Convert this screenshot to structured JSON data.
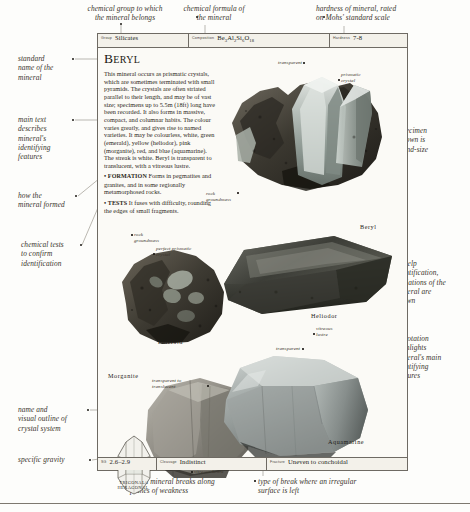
{
  "page": {
    "title": "Beryl",
    "specbar": [
      {
        "label": "Group",
        "value": "Silicates",
        "name": "field-group"
      },
      {
        "label": "Composition",
        "value": "Be3Al2Si6O18",
        "name": "field-composition"
      },
      {
        "label": "Hardness",
        "value": "7-8",
        "name": "field-hardness"
      }
    ],
    "bottombar": [
      {
        "label": "SG",
        "value": "2.6–2.9",
        "name": "field-sg"
      },
      {
        "label": "Cleavage",
        "value": "Indistinct",
        "name": "field-cleavage"
      },
      {
        "label": "Fracture",
        "value": "Uneven to conchoidal",
        "name": "field-fracture"
      }
    ],
    "body": {
      "main": "This mineral occurs as prismatic crystals, which are sometimes terminated with small pyramids. The crystals are often striated parallel to their length, and may be of vast size; specimens up to 5.5m (18ft) long have been recorded. It also forms in massive, compact, and columnar habits. The colour varies greatly, and gives rise to named varieties. It may be colourless, white, green (emerald), yellow (heliodor), pink (morganite), red, and blue (aquamarine). The streak is white. Beryl is transparent to translucent, with a vitreous lustre.",
      "formation_kw": "• FORMATION",
      "formation": "Forms in pegmatites and granites, and in some regionally metamorphosed rocks.",
      "tests_kw": "• TESTS",
      "tests": "It fuses with difficulty, rounding the edges of small fragments."
    },
    "specimen_captions": [
      {
        "text": "Beryl",
        "name": "caption-beryl"
      },
      {
        "text": "Emerald",
        "name": "caption-emerald"
      },
      {
        "text": "Heliodor",
        "name": "caption-heliodor"
      },
      {
        "text": "Morganite",
        "name": "caption-morganite"
      },
      {
        "text": "Aquamarine",
        "name": "caption-aquamarine"
      }
    ],
    "crystal_system": "TRIGONAL/\nHEXAGONAL",
    "inner_annotations": [
      {
        "text": "transparent",
        "name": "anno-transparent-top"
      },
      {
        "text": "prismatic\ncrystal",
        "name": "anno-prismatic-crystal-top"
      },
      {
        "text": "rock\ngroundmass",
        "name": "anno-rock-groundmass-top"
      },
      {
        "text": "rock\ngroundmass",
        "name": "anno-rock-groundmass-emerald"
      },
      {
        "text": "perfect prismatic\ncrystal",
        "name": "anno-perfect-prismatic-crystal"
      },
      {
        "text": "vitreous\nlustre",
        "name": "anno-vitreous-lustre-heliodor"
      },
      {
        "text": "transparent",
        "name": "anno-transparent-heliodor"
      },
      {
        "text": "transparent to\ntranslucent",
        "name": "anno-transparent-translucent"
      },
      {
        "text": "vitreous lustre",
        "name": "anno-vitreous-lustre-aquamarine"
      }
    ],
    "callouts": [
      {
        "text": "chemical group to which\nthe mineral belongs",
        "name": "callout-chemical-group"
      },
      {
        "text": "chemical formula of\nthe mineral",
        "name": "callout-chemical-formula"
      },
      {
        "text": "hardness of mineral, rated\non Mohs' standard scale",
        "name": "callout-hardness"
      },
      {
        "text": "standard\nname of the\nmineral",
        "name": "callout-standard-name"
      },
      {
        "text": "main text\ndescribes\nmineral's\nidentifying\nfeatures",
        "name": "callout-main-text"
      },
      {
        "text": "how the\nmineral formed",
        "name": "callout-how-formed"
      },
      {
        "text": "chemical tests\nto confirm\nidentification",
        "name": "callout-chemical-tests"
      },
      {
        "text": "specimen\nshown is\nhand-size",
        "name": "callout-specimen-size"
      },
      {
        "text": "to help\nidentification,\nvariations of the\nmineral are\nshown",
        "name": "callout-variations"
      },
      {
        "text": "annotation\nhighlights\nmineral's main\nidentifying\nfeatures",
        "name": "callout-annotation"
      },
      {
        "text": "name and\nvisual outline of\ncrystal system",
        "name": "callout-crystal-system"
      },
      {
        "text": "specific gravity",
        "name": "callout-specific-gravity"
      },
      {
        "text": "how a mineral breaks along\nplanes of weakness",
        "name": "callout-cleavage"
      },
      {
        "text": "type of break where an irregular\nsurface is left",
        "name": "callout-fracture"
      }
    ],
    "colors": {
      "page_bg": "#fdfdfb",
      "rule": "#6e6a63",
      "ink": "#2a2520",
      "leader": "#8e8a80"
    }
  }
}
